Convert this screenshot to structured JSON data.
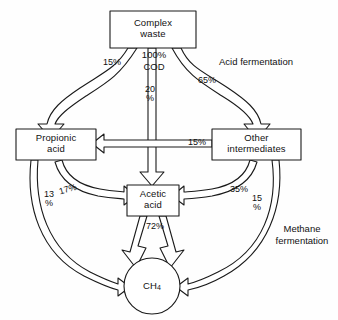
{
  "diagram": {
    "stroke_color": "#1a1a1a",
    "fill_color": "#ffffff",
    "nodes": {
      "complex_waste": "Complex\nwaste",
      "propionic_acid": "Propionic\nacid",
      "other_intermediates": "Other\nintermediates",
      "acetic_acid": "Acetic\nacid",
      "methane": "CH4"
    },
    "captions": {
      "acid_fermentation": "Acid fermentation",
      "methane_fermentation": "Methane\nfermentation",
      "cod_basis": "100%\nCOD"
    },
    "flows": {
      "waste_to_propionic": "15%",
      "waste_to_acetic": "20\n%",
      "waste_to_other": "65%",
      "other_to_propionic": "15%",
      "propionic_to_acetic": "17%",
      "propionic_to_methane": "13\n%",
      "other_to_acetic": "35%",
      "other_to_methane": "15\n%",
      "acetic_to_methane": "72%"
    }
  }
}
